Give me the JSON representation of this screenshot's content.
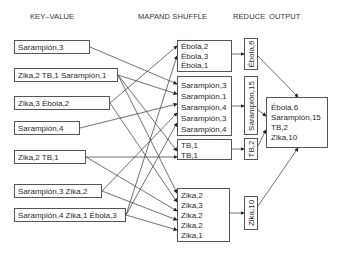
{
  "headers": {
    "key_value": "KEY–VALUE",
    "map_shuffle": "MAPAND SHUFFLE",
    "reduce": "REDUCE",
    "output": "OUTPUT"
  },
  "inputs": [
    "Sarampión,3",
    "Zika,2 TB,1 Sarampión,1",
    "Zika,3 Ébola,2",
    "Sarampión,4",
    "Zika,2 TB,1",
    "Sarampión,3 Zika,2",
    "Sarampión,4 Zika,1 Ébola,3"
  ],
  "shuffle": {
    "ebola": [
      "Ébola,2",
      "Ébola,3",
      "Ébola,1"
    ],
    "sarampion": [
      "Sarampión,3",
      "Sarampión,1",
      "Sarampión,4",
      "Sarampión,3",
      "Sarampión,4"
    ],
    "tb": [
      "TB,1",
      "TB,1"
    ],
    "zika": [
      "Zika,2",
      "Zika,3",
      "Zika,2",
      "Zika,2",
      "Zika,1"
    ]
  },
  "reduce": {
    "ebola": "Ébola,6",
    "sarampion": "Sarampión,15",
    "tb": "TB,2",
    "zika": "Zika,10"
  },
  "output": [
    "Ébola,6",
    "Sarampión,15",
    "TB,2",
    "Zika,10"
  ]
}
